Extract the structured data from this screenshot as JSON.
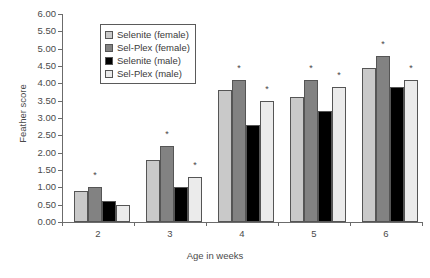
{
  "chart_data": {
    "type": "bar",
    "title": "",
    "xlabel": "Age in weeks",
    "ylabel": "Feather score",
    "categories": [
      "2",
      "3",
      "4",
      "5",
      "6"
    ],
    "ylim": [
      0,
      6
    ],
    "ytick_step": 0.5,
    "ytick_labels": [
      "0.00",
      "0.50",
      "1.00",
      "1.50",
      "2.00",
      "2.50",
      "3.00",
      "3.50",
      "4.00",
      "4.50",
      "5.00",
      "5.50",
      "6.00"
    ],
    "ytick_values": [
      0,
      0.5,
      1,
      1.5,
      2,
      2.5,
      3,
      3.5,
      4,
      4.5,
      5,
      5.5,
      6
    ],
    "grid": false,
    "legend_position": "top-left-inside",
    "series": [
      {
        "name": "Selenite (female)",
        "color": "#c9c9c9",
        "values": [
          0.9,
          1.8,
          3.8,
          3.6,
          4.45
        ]
      },
      {
        "name": "Sel-Plex (female)",
        "color": "#828282",
        "values": [
          1.0,
          2.2,
          4.1,
          4.1,
          4.8
        ]
      },
      {
        "name": "Selenite (male)",
        "color": "#000000",
        "values": [
          0.6,
          1.0,
          2.8,
          3.2,
          3.9
        ]
      },
      {
        "name": "Sel-Plex (male)",
        "color": "#ebebeb",
        "values": [
          0.5,
          1.3,
          3.5,
          3.9,
          4.1
        ]
      }
    ],
    "annotations": {
      "symbol": "*",
      "marks": [
        {
          "category": "2",
          "series_index": 1,
          "value": 1.0
        },
        {
          "category": "3",
          "series_index": 1,
          "value": 2.2
        },
        {
          "category": "3",
          "series_index": 3,
          "value": 1.3
        },
        {
          "category": "4",
          "series_index": 1,
          "value": 4.1
        },
        {
          "category": "4",
          "series_index": 3,
          "value": 3.5
        },
        {
          "category": "5",
          "series_index": 1,
          "value": 4.1
        },
        {
          "category": "5",
          "series_index": 3,
          "value": 3.9
        },
        {
          "category": "6",
          "series_index": 1,
          "value": 4.8
        },
        {
          "category": "6",
          "series_index": 3,
          "value": 4.1
        }
      ]
    }
  },
  "legend": {
    "items": [
      {
        "label": "Selenite (female)",
        "color": "#c9c9c9"
      },
      {
        "label": "Sel-Plex (female)",
        "color": "#828282"
      },
      {
        "label": "Selenite (male)",
        "color": "#000000"
      },
      {
        "label": "Sel-Plex (male)",
        "color": "#ebebeb"
      }
    ]
  }
}
